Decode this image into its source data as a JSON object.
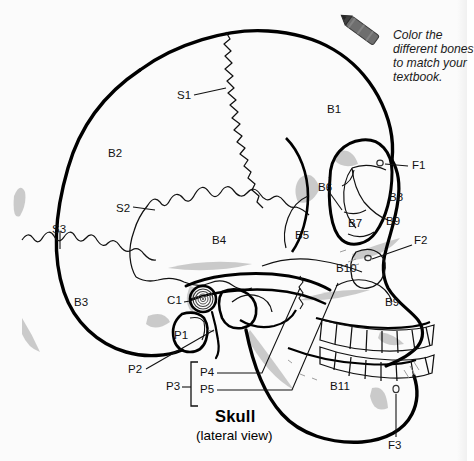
{
  "page": {
    "background_color": "#fbfbfb",
    "ink_color": "#111111",
    "title": "Skull",
    "subtitle": "(lateral view)"
  },
  "instruction": {
    "icon": "crayon-icon",
    "crayon_body_color": "#6e6e6e",
    "crayon_tip_color": "#3c3c3c",
    "line1": "Color the",
    "line2": "different bones",
    "line3": "to match your",
    "line4": "textbook."
  },
  "labels": {
    "bones": [
      {
        "id": "B1",
        "text": "B1",
        "x": 327,
        "y": 104,
        "leader": false
      },
      {
        "id": "B2",
        "text": "B2",
        "x": 108,
        "y": 148,
        "leader": false
      },
      {
        "id": "B3",
        "text": "B3",
        "x": 74,
        "y": 297,
        "leader": false
      },
      {
        "id": "B4",
        "text": "B4",
        "x": 212,
        "y": 235,
        "leader": false
      },
      {
        "id": "B5",
        "text": "B5",
        "x": 295,
        "y": 230,
        "leader": false
      },
      {
        "id": "B6",
        "text": "B6",
        "x": 318,
        "y": 182,
        "leader": true
      },
      {
        "id": "B7",
        "text": "B7",
        "x": 348,
        "y": 218,
        "leader": false
      },
      {
        "id": "B8",
        "text": "B8",
        "x": 389,
        "y": 192,
        "leader": false
      },
      {
        "id": "B9a",
        "text": "B9",
        "x": 386,
        "y": 216,
        "leader": false
      },
      {
        "id": "B10",
        "text": "B10",
        "x": 336,
        "y": 263,
        "leader": false
      },
      {
        "id": "B9b",
        "text": "B9",
        "x": 385,
        "y": 297,
        "leader": false
      },
      {
        "id": "B11",
        "text": "B11",
        "x": 330,
        "y": 381,
        "leader": false
      }
    ],
    "sutures": [
      {
        "id": "S1",
        "text": "S1",
        "x": 177,
        "y": 90,
        "leader": true
      },
      {
        "id": "S2",
        "text": "S2",
        "x": 116,
        "y": 203,
        "leader": true
      },
      {
        "id": "S3",
        "text": "S3",
        "x": 52,
        "y": 224,
        "leader": true
      }
    ],
    "cavities": [
      {
        "id": "C1",
        "text": "C1",
        "x": 167,
        "y": 298,
        "leader": true
      }
    ],
    "processes": [
      {
        "id": "P1",
        "text": "P1",
        "x": 174,
        "y": 334,
        "leader": false
      },
      {
        "id": "P2",
        "text": "P2",
        "x": 128,
        "y": 370,
        "leader": true
      },
      {
        "id": "P3",
        "text": "P3",
        "x": 166,
        "y": 384,
        "leader": true
      },
      {
        "id": "P4",
        "text": "P4",
        "x": 199,
        "y": 372,
        "leader": true
      },
      {
        "id": "P5",
        "text": "P5",
        "x": 199,
        "y": 389,
        "leader": true
      }
    ],
    "foramina": [
      {
        "id": "F1",
        "text": "F1",
        "x": 412,
        "y": 163,
        "leader": true
      },
      {
        "id": "F2",
        "text": "F2",
        "x": 414,
        "y": 239,
        "leader": true
      },
      {
        "id": "F3",
        "text": "F3",
        "x": 393,
        "y": 445,
        "leader": true
      }
    ]
  },
  "diagram": {
    "name": "skull-lateral-view",
    "line_color": "#000000",
    "shade_color": "#b9b9b9",
    "teeth": {
      "upper_count": 8,
      "lower_count": 8
    }
  }
}
